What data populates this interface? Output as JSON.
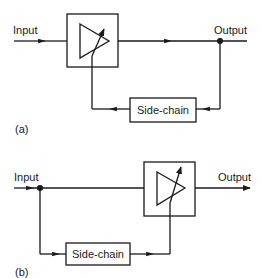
{
  "diagram_a": {
    "input_label": "Input",
    "output_label": "Output",
    "sidechain_label": "Side-chain",
    "caption": "(a)"
  },
  "diagram_b": {
    "input_label": "Input",
    "output_label": "Output",
    "sidechain_label": "Side-chain",
    "caption": "(b)"
  },
  "colors": {
    "line": "#1a1a1a",
    "background": "#ffffff"
  }
}
